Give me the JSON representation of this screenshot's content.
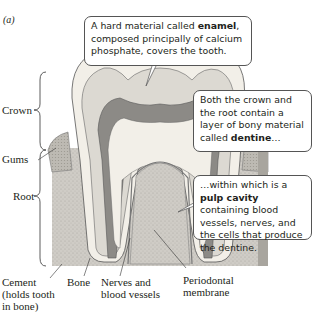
{
  "panel_label": "(a)",
  "labels": {
    "crown": "Crown",
    "gums": "Gums",
    "root": "Root",
    "cement_line1": "Cement",
    "cement_line2": "(holds tooth",
    "cement_line3": "in bone)",
    "bone": "Bone",
    "nerves_line1": "Nerves and",
    "nerves_line2": "blood vessels",
    "periodontal_line1": "Periodontal",
    "periodontal_line2": "membrane"
  },
  "callouts": {
    "enamel": {
      "pre": "A hard material called ",
      "bold": "enamel",
      "post": ", composed principally of calcium phosphate, covers the tooth."
    },
    "dentine": {
      "pre": "Both the crown and the root contain a layer of bony material called ",
      "bold": "dentine",
      "post": "…"
    },
    "pulp": {
      "pre": "…within which is a ",
      "bold": "pulp cavity",
      "post": " containing blood vessels, nerves, and the cells that produce the dentine."
    }
  },
  "colors": {
    "enamel": "#f2efe8",
    "dentine": "#d9d6d0",
    "pulp": "#8c8a86",
    "bone": "#c9c6c0",
    "gum": "#b8b5ae",
    "outline": "#555555"
  }
}
